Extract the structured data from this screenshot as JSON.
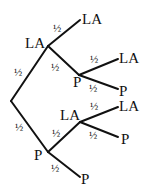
{
  "diagram": {
    "type": "probability-tree",
    "root": {
      "children": [
        {
          "id": "n1",
          "label": "LA",
          "prob": "½",
          "children": [
            {
              "id": "n1a",
              "label": "LA",
              "prob": "½"
            },
            {
              "id": "n1b",
              "label": "P",
              "prob": "½",
              "children": [
                {
                  "id": "n1b1",
                  "label": "LA",
                  "prob": "½"
                },
                {
                  "id": "n1b2",
                  "label": "P",
                  "prob": "½"
                }
              ]
            }
          ]
        },
        {
          "id": "n2",
          "label": "P",
          "prob": "½",
          "children": [
            {
              "id": "n2a",
              "label": "LA",
              "prob": "½",
              "children": [
                {
                  "id": "n2a1",
                  "label": "LA",
                  "prob": "½"
                },
                {
                  "id": "n2a2",
                  "label": "P",
                  "prob": "½"
                }
              ]
            },
            {
              "id": "n2b",
              "label": "P",
              "prob": "½"
            }
          ]
        }
      ]
    }
  }
}
